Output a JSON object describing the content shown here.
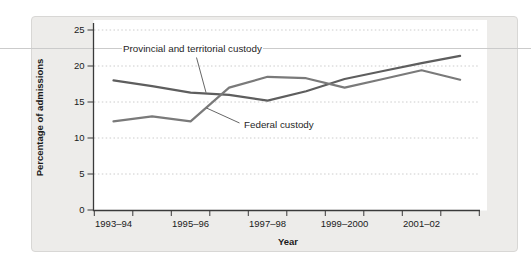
{
  "figure": {
    "ylabel": "Percentage of admissions",
    "xlabel": "Year",
    "annotations": {
      "provincial": "Provincial and territorial custody",
      "federal": "Federal custody"
    }
  },
  "chart_data": {
    "type": "line",
    "title": "",
    "xlabel": "Year",
    "ylabel": "Percentage of admissions",
    "ylim": [
      0,
      25
    ],
    "y_ticks": [
      0,
      5,
      10,
      15,
      20,
      25
    ],
    "grid": "horizontal-dotted",
    "legend": "inline-annotations",
    "categories": [
      "1993–94",
      "1994–95",
      "1995–96",
      "1996–97",
      "1997–98",
      "1998–99",
      "1999–2000",
      "2000–01",
      "2001–02",
      "2002–03"
    ],
    "x_tick_labels": [
      "1993–94",
      "1995–96",
      "1997–98",
      "1999–2000",
      "2001–02"
    ],
    "series": [
      {
        "name": "Provincial and territorial custody",
        "color": "#5e5e5e",
        "values": [
          18,
          17.2,
          16.3,
          16,
          15.2,
          16.5,
          18.2,
          19.3,
          20.4,
          21.4
        ]
      },
      {
        "name": "Federal custody",
        "color": "#7a7a7a",
        "values": [
          12.3,
          13,
          12.3,
          17,
          18.5,
          18.3,
          17,
          18.2,
          19.4,
          18.1
        ]
      }
    ]
  },
  "colors": {
    "panel_bg": "#edecea",
    "panel_border": "#d8d7d5",
    "plot_bg": "#ffffff",
    "axis": "#3a3a3a",
    "gridline": "#bfbfbf",
    "page_rule": "#cbcbcb",
    "tick_text": "#1a1a1a"
  }
}
